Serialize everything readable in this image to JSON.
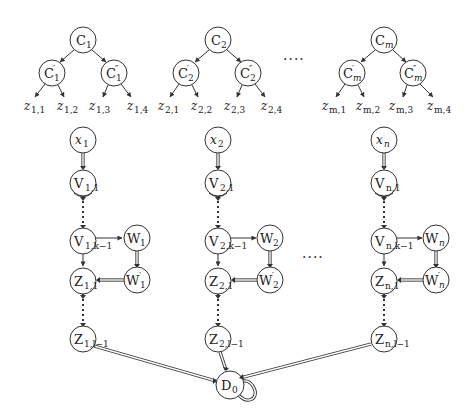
{
  "diagram": {
    "type": "reduction-gadget-graph",
    "trees": [
      {
        "root": "C",
        "root_sub": "1",
        "left": "C",
        "left_sub": "1",
        "left_prime": "′",
        "right": "C",
        "right_sub": "1",
        "right_prime": "″",
        "leaves": [
          {
            "v": "z",
            "s": "1,1"
          },
          {
            "v": "z",
            "s": "1,2"
          },
          {
            "v": "z",
            "s": "1,3"
          },
          {
            "v": "z",
            "s": "1,4"
          }
        ]
      },
      {
        "root": "C",
        "root_sub": "2",
        "left": "C",
        "left_sub": "2",
        "left_prime": "′",
        "right": "C",
        "right_sub": "2",
        "right_prime": "″",
        "leaves": [
          {
            "v": "z",
            "s": "2,1"
          },
          {
            "v": "z",
            "s": "2,2"
          },
          {
            "v": "z",
            "s": "2,3"
          },
          {
            "v": "z",
            "s": "2,4"
          }
        ]
      },
      {
        "root": "C",
        "root_sub": "m",
        "left": "C",
        "left_sub": "m",
        "left_prime": "′",
        "right": "C",
        "right_sub": "m",
        "right_prime": "″",
        "leaves": [
          {
            "v": "z",
            "s": "m,1"
          },
          {
            "v": "z",
            "s": "m,2"
          },
          {
            "v": "z",
            "s": "m,3"
          },
          {
            "v": "z",
            "s": "m,4"
          }
        ]
      }
    ],
    "tree_ellipsis": "····",
    "chains": [
      {
        "x": "x",
        "x_sub": "1",
        "v1": "V",
        "v1_sub": "1,1",
        "vk": "V",
        "vk_sub": "1,k−1",
        "w": "W",
        "w_sub": "1",
        "wp": "W",
        "wp_prime": "′",
        "wp_sub": "1",
        "z1": "Z",
        "z1_sub": "1,1",
        "zl": "Z",
        "zl_sub": "1,l−1"
      },
      {
        "x": "x",
        "x_sub": "2",
        "v1": "V",
        "v1_sub": "2,1",
        "vk": "V",
        "vk_sub": "2,k−1",
        "w": "W",
        "w_sub": "2",
        "wp": "W",
        "wp_prime": "′",
        "wp_sub": "2",
        "z1": "Z",
        "z1_sub": "2,1",
        "zl": "Z",
        "zl_sub": "2,l−1"
      },
      {
        "x": "x",
        "x_sub": "n",
        "v1": "V",
        "v1_sub": "n,1",
        "vk": "V",
        "vk_sub": "n,k−1",
        "w": "W",
        "w_sub": "n",
        "wp": "W",
        "wp_prime": "′",
        "wp_sub": "n",
        "z1": "Z",
        "z1_sub": "n,1",
        "zl": "Z",
        "zl_sub": "n,l−1"
      }
    ],
    "chain_ellipsis": "····",
    "sink": {
      "label": "D",
      "sub": "0"
    },
    "colors": {
      "stroke": "#333333",
      "background": "#ffffff",
      "text": "#222222"
    }
  }
}
